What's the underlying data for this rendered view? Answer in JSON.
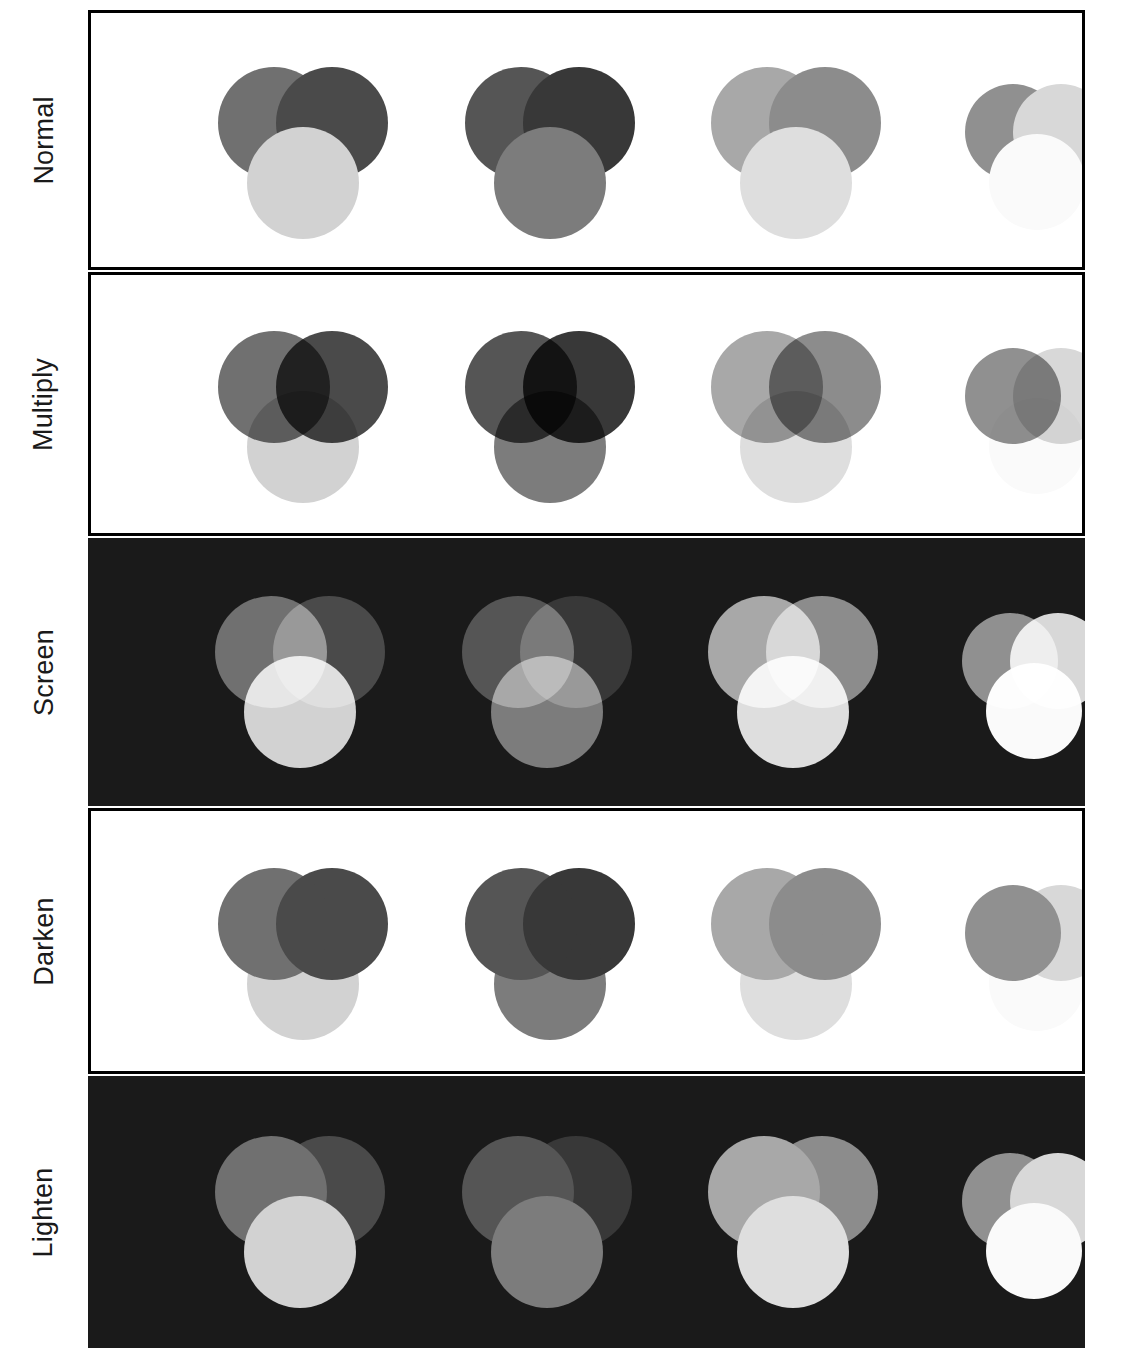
{
  "figure": {
    "width": 1133,
    "height": 1358,
    "panel": {
      "left": 88,
      "top": 10,
      "width": 997,
      "height": 1338
    },
    "background_light": "#ffffff",
    "background_dark": "#1a1a1a",
    "border_color": "#000000"
  },
  "rows": [
    {
      "label": "Normal",
      "blend": "normal",
      "background": "#ffffff",
      "dark": false,
      "top": 10,
      "height": 260
    },
    {
      "label": "Multiply",
      "blend": "multiply",
      "background": "#ffffff",
      "dark": false,
      "top": 272,
      "height": 264
    },
    {
      "label": "Screen",
      "blend": "screen",
      "background": "#1a1a1a",
      "dark": true,
      "top": 538,
      "height": 268
    },
    {
      "label": "Darken",
      "blend": "darken",
      "background": "#ffffff",
      "dark": false,
      "top": 808,
      "height": 266
    },
    {
      "label": "Lighten",
      "blend": "lighten",
      "background": "#1a1a1a",
      "dark": true,
      "top": 1076,
      "height": 272
    }
  ],
  "groups": [
    {
      "name": "group-1",
      "center_x": 127,
      "center_y": 20,
      "diameter": 112,
      "circles": [
        {
          "name": "circle-top-left",
          "color": "#707070",
          "dx": 0,
          "dy": 0
        },
        {
          "name": "circle-top-right",
          "color": "#4a4a4a",
          "dx": 58,
          "dy": 0
        },
        {
          "name": "circle-bottom",
          "color": "#d2d2d2",
          "dx": 29,
          "dy": 60
        }
      ]
    },
    {
      "name": "group-2",
      "center_x": 374,
      "center_y": 20,
      "diameter": 112,
      "circles": [
        {
          "name": "circle-top-left",
          "color": "#555555",
          "dx": 0,
          "dy": 0
        },
        {
          "name": "circle-top-right",
          "color": "#383838",
          "dx": 58,
          "dy": 0
        },
        {
          "name": "circle-bottom",
          "color": "#7c7c7c",
          "dx": 29,
          "dy": 60
        }
      ]
    },
    {
      "name": "group-3",
      "center_x": 620,
      "center_y": 20,
      "diameter": 112,
      "circles": [
        {
          "name": "circle-top-left",
          "color": "#a8a8a8",
          "dx": 0,
          "dy": 0
        },
        {
          "name": "circle-top-right",
          "color": "#8c8c8c",
          "dx": 58,
          "dy": 0
        },
        {
          "name": "circle-bottom",
          "color": "#dedede",
          "dx": 29,
          "dy": 60
        }
      ]
    },
    {
      "name": "group-4",
      "center_x": 874,
      "center_y": 28,
      "diameter": 96,
      "circles": [
        {
          "name": "circle-top-left",
          "color": "#909090",
          "dx": 0,
          "dy": 0
        },
        {
          "name": "circle-top-right",
          "color": "#d8d8d8",
          "dx": 48,
          "dy": 0
        },
        {
          "name": "circle-bottom",
          "color": "#fafafa",
          "dx": 24,
          "dy": 50
        }
      ]
    }
  ]
}
